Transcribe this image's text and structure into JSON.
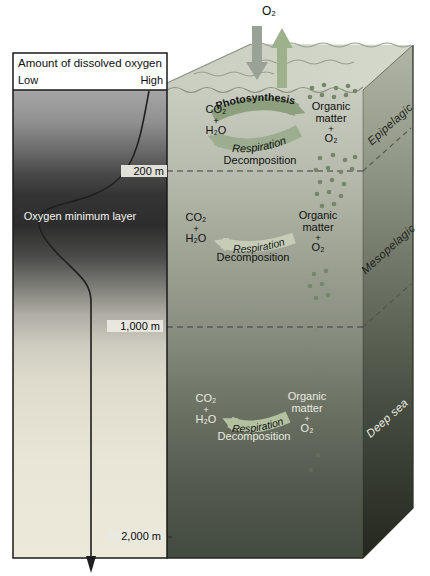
{
  "left_panel": {
    "title": "Amount of dissolved oxygen",
    "scale_low": "Low",
    "scale_high": "High",
    "band_label": "Oxygen minimum layer",
    "depth_markers": [
      "200 m",
      "1,000 m",
      "2,000 m"
    ]
  },
  "surface": {
    "gas_exchange_label": "O₂"
  },
  "zones": [
    {
      "name": "Epipelagic",
      "products": [
        "CO₂",
        "+",
        "H₂O"
      ],
      "arrow1_label": "Photosynthesis",
      "arrow2_label": "Respiration",
      "decomposition_label": "Decomposition",
      "reactants": [
        "Organic",
        "matter",
        "+",
        "O₂"
      ]
    },
    {
      "name": "Mesopelagic",
      "products": [
        "CO₂",
        "+",
        "H₂O"
      ],
      "arrow_label": "Respiration",
      "decomposition_label": "Decomposition",
      "reactants": [
        "Organic",
        "matter",
        "+",
        "O₂"
      ]
    },
    {
      "name": "Deep sea",
      "products": [
        "CO₂",
        "+",
        "H₂O"
      ],
      "arrow_label": "Respiration",
      "decomposition_label": "Decomposition",
      "reactants": [
        "Organic",
        "matter",
        "+",
        "O₂"
      ]
    }
  ],
  "colors": {
    "photosynthesis_arrow": "#8CA07E",
    "respiration_arrow": "#9CAD90",
    "respiration_arrow_faint": "#C6CDB7",
    "respiration_arrow_deep": "#B4C1A1",
    "particle_olive": "#75876B",
    "deep_text": "#E9EBE0",
    "surface_water": "#CDD2C5"
  }
}
